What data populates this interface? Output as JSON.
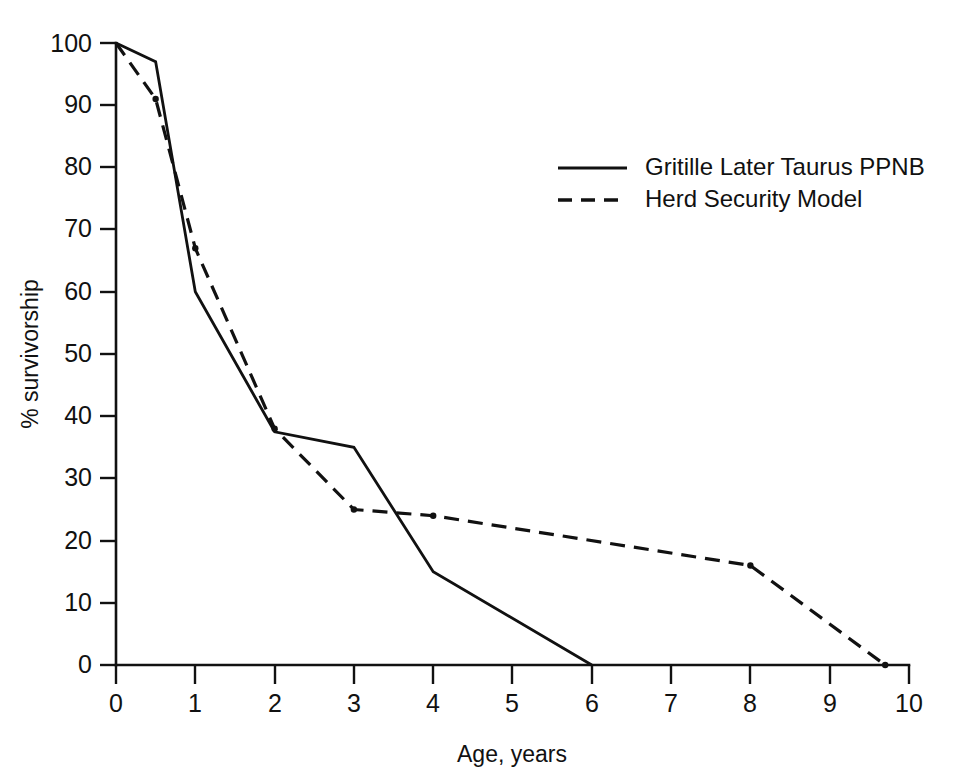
{
  "chart_data": {
    "type": "line",
    "title": "",
    "xlabel": "Age, years",
    "ylabel": "% survivorship",
    "xlim": [
      0,
      10
    ],
    "ylim": [
      0,
      100
    ],
    "grid": false,
    "legend_position": "upper-right-inside",
    "xticks": [
      "0",
      "1",
      "2",
      "3",
      "4",
      "5",
      "6",
      "7",
      "8",
      "9",
      "10"
    ],
    "xtick_values": [
      0,
      1,
      2,
      3,
      4,
      5,
      6,
      7,
      8,
      9,
      10
    ],
    "yticks": [
      "0",
      "10",
      "20",
      "30",
      "40",
      "50",
      "60",
      "70",
      "80",
      "90",
      "100"
    ],
    "ytick_values": [
      0,
      10,
      20,
      30,
      40,
      50,
      60,
      70,
      80,
      90,
      100
    ],
    "series": [
      {
        "name": "Gritille Later Taurus PPNB",
        "style": "solid",
        "markers": false,
        "x": [
          0,
          0.5,
          1,
          2,
          3,
          4,
          6
        ],
        "values": [
          100,
          97,
          60,
          37.5,
          35,
          15,
          0
        ]
      },
      {
        "name": "Herd Security Model",
        "style": "dashed",
        "markers": true,
        "x": [
          0,
          0.5,
          1,
          2,
          3,
          4,
          8,
          9.7
        ],
        "values": [
          100,
          91,
          67,
          38,
          25,
          24,
          16,
          0
        ]
      }
    ]
  },
  "legend": {
    "entries": [
      {
        "label": "Gritille Later Taurus PPNB",
        "style": "solid"
      },
      {
        "label": "Herd Security Model",
        "style": "dashed"
      }
    ]
  },
  "colors": {
    "ink": "#111111",
    "background": "#ffffff"
  },
  "axes": {
    "x_title": "Age, years",
    "y_title": "% survivorship"
  },
  "labels": {
    "y": {
      "t0": "0",
      "t10": "10",
      "t20": "20",
      "t30": "30",
      "t40": "40",
      "t50": "50",
      "t60": "60",
      "t70": "70",
      "t80": "80",
      "t90": "90",
      "t100": "100"
    },
    "x": {
      "t0": "0",
      "t1": "1",
      "t2": "2",
      "t3": "3",
      "t4": "4",
      "t5": "5",
      "t6": "6",
      "t7": "7",
      "t8": "8",
      "t9": "9",
      "t10": "10"
    }
  }
}
